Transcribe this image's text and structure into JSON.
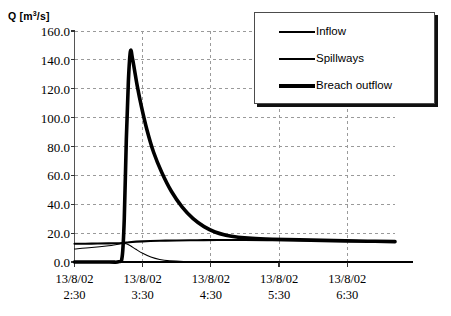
{
  "chart_data": {
    "type": "line",
    "title": "",
    "ylabel": "Q [m3/s]",
    "ylabel_main": "Q [m",
    "ylabel_sup": "3",
    "ylabel_tail": "/s]",
    "xlabel": "",
    "grid": true,
    "legend_position": "top-right",
    "ylim": [
      0,
      160
    ],
    "yticks": [
      "0.0",
      "20.0",
      "40.0",
      "60.0",
      "80.0",
      "100.0",
      "120.0",
      "140.0",
      "160.0"
    ],
    "ytick_values": [
      0,
      20,
      40,
      60,
      80,
      100,
      120,
      140,
      160
    ],
    "xticks": [
      {
        "date": "13/8/02",
        "time": "2:30"
      },
      {
        "date": "13/8/02",
        "time": "3:30"
      },
      {
        "date": "13/8/02",
        "time": "4:30"
      },
      {
        "date": "13/8/02",
        "time": "5:30"
      },
      {
        "date": "13/8/02",
        "time": "6:30"
      }
    ],
    "xlim_hours": [
      2.5,
      7.2
    ],
    "series": [
      {
        "name": "Inflow",
        "line_width": 2.1,
        "color": "#000000",
        "x_hours": [
          2.5,
          2.75,
          3.0,
          3.1,
          3.2,
          3.25,
          3.3,
          3.5,
          3.75,
          4.0,
          4.3,
          4.6,
          5.0,
          5.5,
          6.0,
          6.5,
          7.0,
          7.2
        ],
        "values": [
          12.6,
          12.7,
          12.9,
          13.0,
          13.2,
          13.4,
          13.7,
          14.3,
          14.7,
          14.9,
          15.1,
          15.2,
          15.2,
          15.1,
          14.9,
          14.6,
          14.3,
          14.1
        ]
      },
      {
        "name": "Spillways",
        "line_width": 1.1,
        "color": "#000000",
        "x_hours": [
          2.5,
          2.75,
          3.0,
          3.1,
          3.18,
          3.22,
          3.26,
          3.32,
          3.4,
          3.5,
          3.62,
          3.75,
          3.9,
          4.1,
          4.4,
          5.0,
          6.0,
          7.2
        ],
        "values": [
          9.0,
          10.0,
          11.3,
          12.0,
          12.6,
          12.9,
          12.6,
          11.2,
          8.8,
          6.0,
          3.4,
          1.7,
          0.8,
          0.35,
          0.15,
          0.08,
          0.05,
          0.04
        ]
      },
      {
        "name": "Breach outflow",
        "line_width": 3.6,
        "color": "#000000",
        "x_hours": [
          2.5,
          3.0,
          3.15,
          3.2,
          3.23,
          3.26,
          3.29,
          3.32,
          3.35,
          3.38,
          3.42,
          3.48,
          3.56,
          3.66,
          3.78,
          3.92,
          4.08,
          4.24,
          4.4,
          4.56,
          4.72,
          4.9,
          5.1,
          5.4,
          5.8,
          6.3,
          6.8,
          7.2
        ],
        "values": [
          0.0,
          0.0,
          0.2,
          4.0,
          30.0,
          85.0,
          125.0,
          146.0,
          141.0,
          133.0,
          122.0,
          108.0,
          92.0,
          76.0,
          62.0,
          49.0,
          38.0,
          30.0,
          24.5,
          20.8,
          18.6,
          17.2,
          16.4,
          15.8,
          15.3,
          14.8,
          14.4,
          14.1
        ]
      }
    ]
  },
  "legend": {
    "items": [
      {
        "label": "Inflow",
        "swatch": "line-swatch-medium"
      },
      {
        "label": "Spillways",
        "swatch": "line-swatch-thin"
      },
      {
        "label": "Breach outflow",
        "swatch": "line-swatch-thick"
      }
    ]
  },
  "axes": {
    "y_title_text": "Q [m",
    "y_title_sup": "3",
    "y_title_tail": "/s]"
  }
}
